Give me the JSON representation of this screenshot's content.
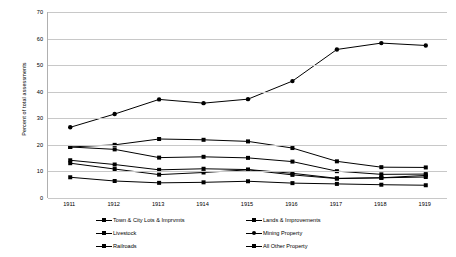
{
  "chart_data": {
    "type": "line",
    "title": "",
    "xlabel": "",
    "ylabel": "Percent of total assessments",
    "categories": [
      "1911",
      "1912",
      "1913",
      "1914",
      "1915",
      "1916",
      "1917",
      "1918",
      "1919"
    ],
    "ylim": [
      0,
      70
    ],
    "yticks": [
      0,
      10,
      20,
      30,
      40,
      50,
      60,
      70
    ],
    "grid": true,
    "legend_position": "bottom",
    "series": [
      {
        "name": "Town & City Lots & Imprvmts",
        "marker": "square",
        "values": [
          19.2,
          20.0,
          22.2,
          21.9,
          21.3,
          18.8,
          13.8,
          11.6,
          11.5
        ]
      },
      {
        "name": "Lands & Improvements",
        "marker": "square",
        "values": [
          19.2,
          18.3,
          15.2,
          15.5,
          15.1,
          13.7,
          10.1,
          8.9,
          9.0
        ]
      },
      {
        "name": "Livestock",
        "marker": "square",
        "values": [
          14.2,
          12.6,
          10.6,
          11.0,
          10.7,
          9.3,
          7.4,
          7.6,
          8.5
        ]
      },
      {
        "name": "Mining Property",
        "marker": "circle",
        "values": [
          26.6,
          31.6,
          37.1,
          35.7,
          37.2,
          44.0,
          55.9,
          58.3,
          57.4
        ]
      },
      {
        "name": "Railroads",
        "marker": "square",
        "values": [
          13.1,
          10.9,
          8.8,
          9.6,
          10.6,
          8.7,
          7.3,
          7.6,
          7.9
        ]
      },
      {
        "name": "All Other Property",
        "marker": "square",
        "values": [
          7.8,
          6.4,
          5.7,
          5.9,
          6.3,
          5.6,
          5.3,
          5.0,
          4.8
        ]
      }
    ]
  },
  "legend": {
    "rows": [
      [
        {
          "label": "Town & City Lots & Imprvmts",
          "marker": "square"
        },
        {
          "label": "Lands & Improvements",
          "marker": "square"
        }
      ],
      [
        {
          "label": "Livestock",
          "marker": "square"
        },
        {
          "label": "Mining Property",
          "marker": "round"
        }
      ],
      [
        {
          "label": "Railroads",
          "marker": "square"
        },
        {
          "label": "All Other Property",
          "marker": "square"
        }
      ]
    ]
  },
  "colors": {
    "line": "#000000",
    "grid": "#c8c8c8",
    "axis": "#b0b0b0",
    "background": "#ffffff"
  }
}
